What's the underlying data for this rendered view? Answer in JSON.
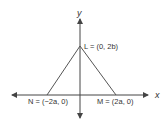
{
  "diagram": {
    "type": "coordinate-triangle",
    "axes": {
      "x_label": "x",
      "y_label": "y"
    },
    "points": [
      {
        "id": "L",
        "label": "L = (0, 2b)",
        "coords": [
          0,
          "2b"
        ]
      },
      {
        "id": "N",
        "label": "N = (−2a, 0)",
        "coords": [
          "-2a",
          0
        ]
      },
      {
        "id": "M",
        "label": "M = (2a, 0)",
        "coords": [
          "2a",
          0
        ]
      }
    ],
    "stroke_color": "#555555"
  }
}
